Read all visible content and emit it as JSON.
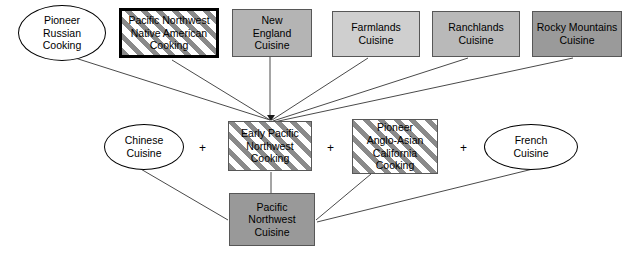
{
  "diagram": {
    "canvas": {
      "width": 627,
      "height": 259,
      "background": "#ffffff"
    },
    "nodes": [
      {
        "id": "pioneer-russian-cooking",
        "label": "Pioneer\nRussian\nCooking",
        "shape": "ellipse",
        "fill": "#ffffff",
        "stroke": "#000000",
        "x": 18,
        "y": 5,
        "w": 88,
        "h": 56
      },
      {
        "id": "pacific-northwest-native-american-cooking",
        "label": "Pacific Northwest\nNative American\nCooking",
        "shape": "rect-thick",
        "fill": "striped",
        "stroke": "#000000",
        "x": 119,
        "y": 8,
        "w": 100,
        "h": 50
      },
      {
        "id": "new-england-cuisine",
        "label": "New\nEngland\nCuisine",
        "shape": "rect",
        "fill": "#b4b4b4",
        "stroke": "#575757",
        "x": 232,
        "y": 9,
        "w": 80,
        "h": 48
      },
      {
        "id": "farmlands-cuisine",
        "label": "Farmlands\nCuisine",
        "shape": "rect",
        "fill": "#cfcfcf",
        "stroke": "#575757",
        "x": 332,
        "y": 11,
        "w": 88,
        "h": 46
      },
      {
        "id": "ranchlands-cuisine",
        "label": "Ranchlands\nCuisine",
        "shape": "rect",
        "fill": "#b9b9b9",
        "stroke": "#575757",
        "x": 432,
        "y": 11,
        "w": 88,
        "h": 46
      },
      {
        "id": "rocky-mountains-cuisine",
        "label": "Rocky Mountains\nCuisine",
        "shape": "rect",
        "fill": "#9a9a9a",
        "stroke": "#575757",
        "x": 532,
        "y": 11,
        "w": 90,
        "h": 46
      },
      {
        "id": "chinese-cuisine",
        "label": "Chinese\nCuisine",
        "shape": "ellipse",
        "fill": "#ffffff",
        "stroke": "#000000",
        "x": 104,
        "y": 124,
        "w": 80,
        "h": 46
      },
      {
        "id": "early-pacific-northwest-cooking",
        "label": "Early Pacific\nNorthwest\nCooking",
        "shape": "rect",
        "fill": "striped",
        "stroke": "#575757",
        "x": 228,
        "y": 121,
        "w": 84,
        "h": 50
      },
      {
        "id": "pioneer-anglo-asian-california-cooking",
        "label": "Pioneer\nAnglo-Asian\nCalifornia\nCooking",
        "shape": "rect",
        "fill": "striped",
        "stroke": "#575757",
        "x": 352,
        "y": 119,
        "w": 86,
        "h": 55
      },
      {
        "id": "french-cuisine",
        "label": "French\nCuisine",
        "shape": "ellipse",
        "fill": "#ffffff",
        "stroke": "#000000",
        "x": 484,
        "y": 124,
        "w": 94,
        "h": 46
      },
      {
        "id": "pacific-northwest-cuisine",
        "label": "Pacific\nNorthwest\nCuisine",
        "shape": "rect",
        "fill": "#999999",
        "stroke": "#575757",
        "x": 229,
        "y": 193,
        "w": 86,
        "h": 53
      }
    ],
    "operators": [
      {
        "id": "plus-1",
        "symbol": "+",
        "x": 199,
        "y": 142
      },
      {
        "id": "plus-2",
        "symbol": "+",
        "x": 327,
        "y": 142
      },
      {
        "id": "plus-3",
        "symbol": "+",
        "x": 460,
        "y": 142
      }
    ],
    "edges": [
      {
        "id": "edge-russian-to-early",
        "from": "pioneer-russian-cooking",
        "to": "early-pacific-northwest-cooking",
        "x1": 72,
        "y1": 57,
        "x2": 270,
        "y2": 120,
        "arrow": true
      },
      {
        "id": "edge-native-to-early",
        "from": "pacific-northwest-native-american-cooking",
        "to": "early-pacific-northwest-cooking",
        "x1": 172,
        "y1": 60,
        "x2": 270,
        "y2": 120,
        "arrow": true
      },
      {
        "id": "edge-newengland-to-early",
        "from": "new-england-cuisine",
        "to": "early-pacific-northwest-cooking",
        "x1": 270,
        "y1": 57,
        "x2": 270,
        "y2": 120,
        "arrow": true
      },
      {
        "id": "edge-farmlands-to-early",
        "from": "farmlands-cuisine",
        "to": "early-pacific-northwest-cooking",
        "x1": 368,
        "y1": 58,
        "x2": 272,
        "y2": 120,
        "arrow": true
      },
      {
        "id": "edge-ranchlands-to-early",
        "from": "ranchlands-cuisine",
        "to": "early-pacific-northwest-cooking",
        "x1": 468,
        "y1": 58,
        "x2": 273,
        "y2": 121,
        "arrow": true
      },
      {
        "id": "edge-rocky-to-early",
        "from": "rocky-mountains-cuisine",
        "to": "early-pacific-northwest-cooking",
        "x1": 573,
        "y1": 58,
        "x2": 274,
        "y2": 122,
        "arrow": true
      },
      {
        "id": "edge-chinese-to-pnw",
        "from": "chinese-cuisine",
        "to": "pacific-northwest-cuisine",
        "x1": 139,
        "y1": 168,
        "x2": 228,
        "y2": 220,
        "arrow": false
      },
      {
        "id": "edge-early-to-pnw",
        "from": "early-pacific-northwest-cooking",
        "to": "pacific-northwest-cuisine",
        "x1": 271,
        "y1": 172,
        "x2": 271,
        "y2": 193,
        "arrow": false
      },
      {
        "id": "edge-angloasian-to-pnw",
        "from": "pioneer-anglo-asian-california-cooking",
        "to": "pacific-northwest-cuisine",
        "x1": 371,
        "y1": 174,
        "x2": 316,
        "y2": 220,
        "arrow": false
      },
      {
        "id": "edge-french-to-pnw",
        "from": "french-cuisine",
        "to": "pacific-northwest-cuisine",
        "x1": 537,
        "y1": 168,
        "x2": 317,
        "y2": 222,
        "arrow": false
      }
    ]
  }
}
